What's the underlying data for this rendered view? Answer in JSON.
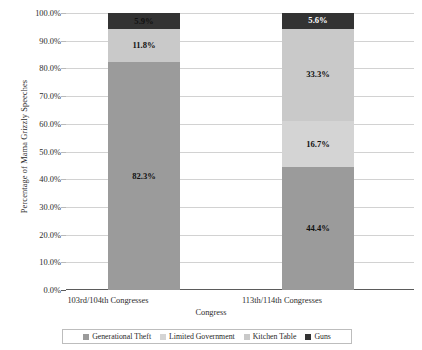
{
  "chart_data": {
    "type": "bar",
    "subtype": "stacked-100-percent",
    "title": "",
    "xlabel": "Congress",
    "ylabel": "Percentage of Mama Grizzly Speeches",
    "categories": [
      "103rd/104th Congresses",
      "113th/114th Congresses"
    ],
    "ylim": [
      0,
      100
    ],
    "ytick_labels": [
      "0.0%",
      "10.0%",
      "20.0%",
      "30.0%",
      "40.0%",
      "50.0%",
      "60.0%",
      "70.0%",
      "80.0%",
      "90.0%",
      "100.0%"
    ],
    "ytick_values": [
      0,
      10,
      20,
      30,
      40,
      50,
      60,
      70,
      80,
      90,
      100
    ],
    "grid": true,
    "legend_position": "bottom",
    "series": [
      {
        "name": "Generational Theft",
        "color": "#9b9b9b",
        "values": [
          82.3,
          44.4
        ],
        "labels": [
          "82.3%",
          "44.4%"
        ],
        "label_colors": [
          "#111111",
          "#111111"
        ]
      },
      {
        "name": "Limited Government",
        "color": "#d4d4d4",
        "values": [
          0.0,
          16.7
        ],
        "labels": [
          "",
          "16.7%"
        ],
        "label_colors": [
          "#111111",
          "#111111"
        ]
      },
      {
        "name": "Kitchen Table",
        "color": "#c9c9c9",
        "values": [
          11.8,
          33.3
        ],
        "labels": [
          "11.8%",
          "33.3%"
        ],
        "label_colors": [
          "#111111",
          "#111111"
        ]
      },
      {
        "name": "Guns",
        "color": "#333333",
        "values": [
          5.9,
          5.6
        ],
        "labels": [
          "5.9%",
          "5.6%"
        ],
        "label_colors": [
          "#111111",
          "#ffffff"
        ]
      }
    ]
  },
  "legend": {
    "items": [
      {
        "label": "Generational Theft",
        "color": "#9b9b9b"
      },
      {
        "label": "Limited Government",
        "color": "#d4d4d4"
      },
      {
        "label": "Kitchen Table",
        "color": "#c9c9c9"
      },
      {
        "label": "Guns",
        "color": "#333333"
      }
    ]
  },
  "axes": {
    "y_title": "Percentage of Mama Grizzly Speeches",
    "x_title": "Congress"
  }
}
